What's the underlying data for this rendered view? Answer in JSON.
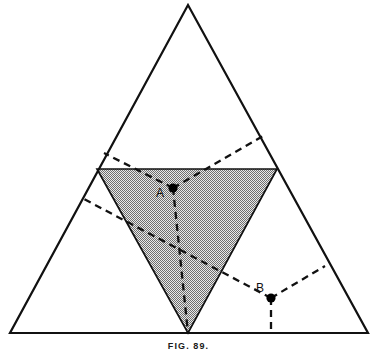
{
  "figure": {
    "caption": "FIG. 89.",
    "canvas": {
      "width": 377,
      "height": 352
    },
    "colors": {
      "stroke": "#111111",
      "shade_fill": "#a8a8a8",
      "background": "#ffffff",
      "marker": "#000000"
    }
  },
  "labels": {
    "point_a": "A",
    "point_b": "B"
  },
  "chart_data": {
    "type": "diagram",
    "title": "FIG. 89.",
    "outer_triangle": {
      "name": "outer-triangle",
      "vertices": [
        {
          "name": "apex",
          "x": 188,
          "y": 5
        },
        {
          "name": "bottom-left",
          "x": 10,
          "y": 333
        },
        {
          "name": "bottom-right",
          "x": 368,
          "y": 333
        }
      ],
      "fill": "none",
      "stroke": "#111111",
      "stroke_width": 2.2
    },
    "shaded_triangle": {
      "name": "shaded-inverted-triangle",
      "vertices": [
        {
          "name": "top-left",
          "x": 97,
          "y": 169
        },
        {
          "name": "top-right",
          "x": 277,
          "y": 169
        },
        {
          "name": "bottom-apex",
          "x": 188,
          "y": 333
        }
      ],
      "fill": "#a8a8a8",
      "fill_pattern": "halftone-checker",
      "stroke": "#111111",
      "stroke_width": 1.6
    },
    "points": [
      {
        "name": "point-A",
        "label": "A",
        "x": 173,
        "y": 188,
        "label_offset": {
          "dx": -13,
          "dy": 9
        },
        "marker": "filled-circle",
        "rays": [
          {
            "name": "A-ray-upper-left",
            "to_x": 104,
            "to_y": 153
          },
          {
            "name": "A-ray-upper-right",
            "to_x": 263,
            "to_y": 136
          },
          {
            "name": "A-ray-down",
            "to_x": 188,
            "to_y": 333
          }
        ]
      },
      {
        "name": "point-B",
        "label": "B",
        "x": 271,
        "y": 298,
        "label_offset": {
          "dx": -11,
          "dy": -6
        },
        "marker": "filled-circle",
        "rays": [
          {
            "name": "B-ray-upper-left",
            "to_x": 82,
            "to_y": 198
          },
          {
            "name": "B-ray-upper-right",
            "to_x": 325,
            "to_y": 266
          },
          {
            "name": "B-ray-down",
            "to_x": 271,
            "to_y": 333
          }
        ]
      }
    ],
    "dashed_style": {
      "dash": "7,5",
      "width": 2.3,
      "color": "#111111"
    },
    "grid": false,
    "legend": false
  }
}
